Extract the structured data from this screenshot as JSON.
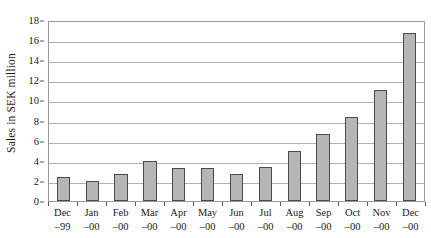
{
  "chart_data": {
    "type": "bar",
    "title": "",
    "subtitle": "",
    "xlabel": "",
    "ylabel": "Sales in SEK million",
    "categories": [
      "Dec -99",
      "Jan -00",
      "Feb -00",
      "Mar -00",
      "Apr -00",
      "May -00",
      "Jun -00",
      "Jul -00",
      "Aug -00",
      "Sep -00",
      "Oct -00",
      "Nov -00",
      "Dec -00"
    ],
    "category_lines": [
      {
        "month": "Dec",
        "year": "–99"
      },
      {
        "month": "Jan",
        "year": "–00"
      },
      {
        "month": "Feb",
        "year": "–00"
      },
      {
        "month": "Mar",
        "year": "–00"
      },
      {
        "month": "Apr",
        "year": "–00"
      },
      {
        "month": "May",
        "year": "–00"
      },
      {
        "month": "Jun",
        "year": "–00"
      },
      {
        "month": "Jul",
        "year": "–00"
      },
      {
        "month": "Aug",
        "year": "–00"
      },
      {
        "month": "Sep",
        "year": "–00"
      },
      {
        "month": "Oct",
        "year": "–00"
      },
      {
        "month": "Nov",
        "year": "–00"
      },
      {
        "month": "Dec",
        "year": "–00"
      }
    ],
    "values": [
      2.4,
      2.0,
      2.7,
      4.0,
      3.3,
      3.3,
      2.7,
      3.4,
      5.0,
      6.7,
      8.4,
      11.0,
      16.7
    ],
    "ylim": [
      0,
      18
    ],
    "ytick_values": [
      0,
      2,
      4,
      6,
      8,
      10,
      12,
      14,
      16,
      18
    ],
    "ytick_labels": [
      "0",
      "2",
      "4",
      "6",
      "8",
      "10",
      "12",
      "14",
      "16",
      "18"
    ],
    "grid": true,
    "grid_axis": "y",
    "legend": false,
    "legend_position": "none",
    "bar_fill_color": "#b6b6b6",
    "bar_border_color": "#4a4a4a",
    "gridline_color": "#b0b0b0",
    "plot_border_color": "#9a9a9a",
    "text_color": "#1a1a1a"
  }
}
